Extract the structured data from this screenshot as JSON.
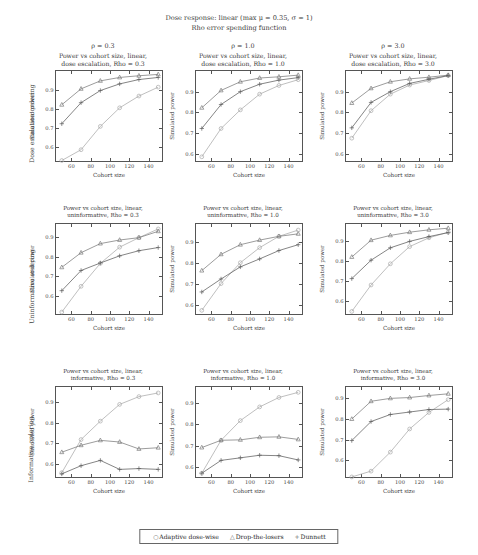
{
  "suptitle": {
    "line1": "Dose response: linear (max μ = 0.35, σ = 1)",
    "line2": "Rho error spending function"
  },
  "columns": [
    {
      "rho_label": "ρ = 0.3",
      "rho": 0.3
    },
    {
      "rho_label": "ρ = 1.0",
      "rho": 1.0
    },
    {
      "rho_label": "ρ = 3.0",
      "rho": 3.0
    }
  ],
  "rows": [
    {
      "label": "Dose escalation ordering"
    },
    {
      "label": "Uninformative ordering"
    },
    {
      "label": "Informative ordering"
    }
  ],
  "legend": {
    "position": "bottom-center",
    "entries": [
      {
        "marker": "○",
        "label": "Adaptive dose-wise"
      },
      {
        "marker": "△",
        "label": "Drop-the-losers"
      },
      {
        "marker": "+",
        "label": "Dunnett"
      }
    ]
  },
  "axis": {
    "xlabel": "Cohort size",
    "ylabel": "Simulated power"
  },
  "colors": {
    "adaptive_dose_wise": "#a9a9a9",
    "drop_the_losers": "#7b7b7b",
    "dunnett": "#5c5c5c",
    "axis": "#555555",
    "text": "#3a3a3a"
  },
  "chart_data": [
    {
      "type": "line",
      "panel": "r0c0",
      "title": "Power vs cohort size, linear,\ndose escalation, Rho = 0.3",
      "xlabel": "Cohort size",
      "ylabel": "Simulated power",
      "x": [
        50,
        70,
        90,
        110,
        130,
        150
      ],
      "xlim": [
        44,
        156
      ],
      "ylim": [
        0.515,
        1.0
      ],
      "xticks": [
        60,
        80,
        100,
        120,
        140
      ],
      "yticks": [
        0.6,
        0.7,
        0.8,
        0.9
      ],
      "ytick_labels": [
        "0.6",
        "0.7",
        "0.8",
        "0.9"
      ],
      "grid": false,
      "series": [
        {
          "name": "Adaptive dose-wise",
          "marker": "circle",
          "values": [
            0.528,
            0.585,
            0.708,
            0.806,
            0.868,
            0.915
          ]
        },
        {
          "name": "Drop-the-losers",
          "marker": "triangle",
          "values": [
            0.822,
            0.906,
            0.948,
            0.966,
            0.975,
            0.982
          ]
        },
        {
          "name": "Dunnett",
          "marker": "plus",
          "values": [
            0.722,
            0.833,
            0.897,
            0.932,
            0.955,
            0.966
          ]
        }
      ]
    },
    {
      "type": "line",
      "panel": "r0c1",
      "title": "Power vs cohort size, linear,\ndose escalation, Rho = 1.0",
      "xlabel": "Cohort size",
      "ylabel": "Simulated power",
      "x": [
        50,
        70,
        90,
        110,
        130,
        150
      ],
      "xlim": [
        44,
        156
      ],
      "ylim": [
        0.555,
        1.0
      ],
      "xticks": [
        60,
        80,
        100,
        120,
        140
      ],
      "yticks": [
        0.6,
        0.7,
        0.8,
        0.9
      ],
      "ytick_labels": [
        "0.6",
        "0.7",
        "0.8",
        "0.9"
      ],
      "grid": false,
      "series": [
        {
          "name": "Adaptive dose-wise",
          "marker": "circle",
          "values": [
            0.585,
            0.722,
            0.812,
            0.888,
            0.93,
            0.958
          ]
        },
        {
          "name": "Drop-the-losers",
          "marker": "triangle",
          "values": [
            0.822,
            0.906,
            0.948,
            0.966,
            0.972,
            0.98
          ]
        },
        {
          "name": "Dunnett",
          "marker": "plus",
          "values": [
            0.722,
            0.838,
            0.9,
            0.936,
            0.956,
            0.968
          ]
        }
      ]
    },
    {
      "type": "line",
      "panel": "r0c2",
      "title": "Power vs cohort size, linear,\ndose escalation, Rho = 3.0",
      "xlabel": "Cohort size",
      "ylabel": "Simulated power",
      "x": [
        50,
        70,
        90,
        110,
        130,
        150
      ],
      "xlim": [
        44,
        156
      ],
      "ylim": [
        0.555,
        1.0
      ],
      "xticks": [
        60,
        80,
        100,
        120,
        140
      ],
      "yticks": [
        0.6,
        0.7,
        0.8,
        0.9
      ],
      "ytick_labels": [
        "0.6",
        "0.7",
        "0.8",
        "0.9"
      ],
      "grid": false,
      "series": [
        {
          "name": "Adaptive dose-wise",
          "marker": "circle",
          "values": [
            0.675,
            0.808,
            0.888,
            0.932,
            0.954,
            0.978
          ]
        },
        {
          "name": "Drop-the-losers",
          "marker": "triangle",
          "values": [
            0.845,
            0.916,
            0.948,
            0.962,
            0.97,
            0.98
          ]
        },
        {
          "name": "Dunnett",
          "marker": "plus",
          "values": [
            0.725,
            0.848,
            0.9,
            0.94,
            0.96,
            0.978
          ]
        }
      ]
    },
    {
      "type": "line",
      "panel": "r1c0",
      "title": "Power vs cohort size, linear,\nuninformative, Rho = 0.3",
      "xlabel": "Cohort size",
      "ylabel": "Simulated power",
      "x": [
        50,
        70,
        90,
        110,
        130,
        150
      ],
      "xlim": [
        44,
        156
      ],
      "ylim": [
        0.5,
        0.965
      ],
      "xticks": [
        60,
        80,
        100,
        120,
        140
      ],
      "yticks": [
        0.6,
        0.7,
        0.8,
        0.9
      ],
      "ytick_labels": [
        "0.6",
        "0.7",
        "0.8",
        "0.9"
      ],
      "grid": false,
      "series": [
        {
          "name": "Adaptive dose-wise",
          "marker": "circle",
          "values": [
            0.52,
            0.65,
            0.766,
            0.848,
            0.896,
            0.94
          ]
        },
        {
          "name": "Drop-the-losers",
          "marker": "triangle",
          "values": [
            0.746,
            0.82,
            0.866,
            0.884,
            0.896,
            0.928
          ]
        },
        {
          "name": "Dunnett",
          "marker": "plus",
          "values": [
            0.628,
            0.73,
            0.768,
            0.804,
            0.83,
            0.846
          ]
        }
      ]
    },
    {
      "type": "line",
      "panel": "r1c1",
      "title": "Power vs cohort size, linear,\nuninformative, Rho = 1.0",
      "xlabel": "Cohort size",
      "ylabel": "Simulated power",
      "x": [
        50,
        70,
        90,
        110,
        130,
        150
      ],
      "xlim": [
        44,
        156
      ],
      "ylim": [
        0.545,
        0.985
      ],
      "xticks": [
        60,
        80,
        100,
        120,
        140
      ],
      "yticks": [
        0.6,
        0.7,
        0.8,
        0.9
      ],
      "ytick_labels": [
        "0.6",
        "0.7",
        "0.8",
        "0.9"
      ],
      "grid": false,
      "series": [
        {
          "name": "Adaptive dose-wise",
          "marker": "circle",
          "values": [
            0.572,
            0.7,
            0.8,
            0.872,
            0.926,
            0.956
          ]
        },
        {
          "name": "Drop-the-losers",
          "marker": "triangle",
          "values": [
            0.762,
            0.84,
            0.886,
            0.908,
            0.926,
            0.938
          ]
        },
        {
          "name": "Dunnett",
          "marker": "plus",
          "values": [
            0.66,
            0.722,
            0.78,
            0.818,
            0.858,
            0.886
          ]
        }
      ]
    },
    {
      "type": "line",
      "panel": "r1c2",
      "title": "Power vs cohort size, linear,\nuninformative, Rho = 3.0",
      "xlabel": "Cohort size",
      "ylabel": "Simulated power",
      "x": [
        50,
        70,
        90,
        110,
        130,
        150
      ],
      "xlim": [
        44,
        156
      ],
      "ylim": [
        0.525,
        0.985
      ],
      "xticks": [
        60,
        80,
        100,
        120,
        140
      ],
      "yticks": [
        0.6,
        0.7,
        0.8,
        0.9
      ],
      "ytick_labels": [
        "0.6",
        "0.7",
        "0.8",
        "0.9"
      ],
      "grid": false,
      "series": [
        {
          "name": "Adaptive dose-wise",
          "marker": "circle",
          "values": [
            0.548,
            0.68,
            0.786,
            0.872,
            0.916,
            0.944
          ]
        },
        {
          "name": "Drop-the-losers",
          "marker": "triangle",
          "values": [
            0.82,
            0.904,
            0.928,
            0.944,
            0.956,
            0.964
          ]
        },
        {
          "name": "Dunnett",
          "marker": "plus",
          "values": [
            0.712,
            0.804,
            0.866,
            0.898,
            0.922,
            0.942
          ]
        }
      ]
    },
    {
      "type": "line",
      "panel": "r2c0",
      "title": "Power vs cohort size, linear,\ninformative, Rho = 0.3",
      "xlabel": "Cohort size",
      "ylabel": "Simulated power",
      "x": [
        50,
        70,
        90,
        110,
        130,
        150
      ],
      "xlim": [
        44,
        156
      ],
      "ylim": [
        0.525,
        0.975
      ],
      "xticks": [
        60,
        80,
        100,
        120,
        140
      ],
      "yticks": [
        0.6,
        0.7,
        0.8,
        0.9
      ],
      "ytick_labels": [
        "0.6",
        "0.7",
        "0.8",
        "0.9"
      ],
      "grid": false,
      "series": [
        {
          "name": "Adaptive dose-wise",
          "marker": "circle",
          "values": [
            0.556,
            0.718,
            0.808,
            0.89,
            0.928,
            0.946
          ]
        },
        {
          "name": "Drop-the-losers",
          "marker": "triangle",
          "values": [
            0.656,
            0.69,
            0.714,
            0.706,
            0.672,
            0.678
          ]
        },
        {
          "name": "Dunnett",
          "marker": "plus",
          "values": [
            0.55,
            0.59,
            0.616,
            0.572,
            0.576,
            0.572
          ]
        }
      ]
    },
    {
      "type": "line",
      "panel": "r2c1",
      "title": "Power vs cohort size, linear,\ninformative, Rho = 1.0",
      "xlabel": "Cohort size",
      "ylabel": "Simulated power",
      "x": [
        50,
        70,
        90,
        110,
        130,
        150
      ],
      "xlim": [
        44,
        156
      ],
      "ylim": [
        0.545,
        0.975
      ],
      "xticks": [
        60,
        80,
        100,
        120,
        140
      ],
      "yticks": [
        0.6,
        0.7,
        0.8,
        0.9
      ],
      "ytick_labels": [
        "0.6",
        "0.7",
        "0.8",
        "0.9"
      ],
      "grid": false,
      "series": [
        {
          "name": "Adaptive dose-wise",
          "marker": "circle",
          "values": [
            0.572,
            0.726,
            0.818,
            0.882,
            0.926,
            0.95
          ]
        },
        {
          "name": "Drop-the-losers",
          "marker": "triangle",
          "values": [
            0.692,
            0.726,
            0.728,
            0.74,
            0.742,
            0.73
          ]
        },
        {
          "name": "Dunnett",
          "marker": "plus",
          "values": [
            0.572,
            0.632,
            0.644,
            0.656,
            0.654,
            0.634
          ]
        }
      ]
    },
    {
      "type": "line",
      "panel": "r2c2",
      "title": "Power vs cohort size, linear,\ninformative, Rho = 3.0",
      "xlabel": "Cohort size",
      "ylabel": "Simulated power",
      "x": [
        50,
        70,
        90,
        110,
        130,
        150
      ],
      "xlim": [
        44,
        156
      ],
      "ylim": [
        0.51,
        0.955
      ],
      "xticks": [
        60,
        80,
        100,
        120,
        140
      ],
      "yticks": [
        0.6,
        0.7,
        0.8,
        0.9
      ],
      "ytick_labels": [
        "0.6",
        "0.7",
        "0.8",
        "0.9"
      ],
      "grid": false,
      "series": [
        {
          "name": "Adaptive dose-wise",
          "marker": "circle",
          "values": [
            0.52,
            0.548,
            0.64,
            0.752,
            0.832,
            0.894
          ]
        },
        {
          "name": "Drop-the-losers",
          "marker": "triangle",
          "values": [
            0.8,
            0.886,
            0.9,
            0.904,
            0.914,
            0.922
          ]
        },
        {
          "name": "Dunnett",
          "marker": "plus",
          "values": [
            0.696,
            0.788,
            0.822,
            0.834,
            0.846,
            0.848
          ]
        }
      ]
    }
  ]
}
